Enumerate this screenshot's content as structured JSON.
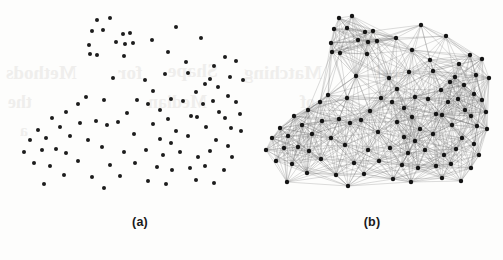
{
  "figure": {
    "background_color": "#fdfdfc",
    "panels": [
      {
        "id": "a",
        "caption": "(a)",
        "kind": "scatter",
        "description": "Scattered point set"
      },
      {
        "id": "b",
        "caption": "(b)",
        "kind": "graph",
        "description": "Proximity graph built on the point set"
      }
    ]
  },
  "captions": {
    "panel_a": "(a)",
    "panel_b": "(b)"
  },
  "style": {
    "point_color": "#1c1c1c",
    "node_color": "#141414",
    "edge_color": "#6f6f6f",
    "caption_color": "#1a1a1a",
    "bleed_color": "#efeeec",
    "point_radius": 2.0,
    "node_radius": 2.2,
    "edge_width": 0.45,
    "edge_opacity": 0.55
  },
  "bleed_through": [
    {
      "text": "Methods",
      "x": 6,
      "y": 62,
      "size": 19
    },
    {
      "text": "for",
      "x": 118,
      "y": 62,
      "size": 19
    },
    {
      "text": "Shape",
      "x": 168,
      "y": 60,
      "size": 19
    },
    {
      "text": "Matching",
      "x": 244,
      "y": 62,
      "size": 19
    },
    {
      "text": "and",
      "x": 376,
      "y": 62,
      "size": 19
    },
    {
      "text": "the",
      "x": 8,
      "y": 92,
      "size": 18
    },
    {
      "text": "Median",
      "x": 148,
      "y": 92,
      "size": 18
    },
    {
      "text": "of",
      "x": 300,
      "y": 92,
      "size": 18
    },
    {
      "text": "a",
      "x": 20,
      "y": 122,
      "size": 16
    }
  ],
  "chart_data": [
    {
      "type": "scatter",
      "title": "(a)",
      "xlabel": "",
      "ylabel": "",
      "grid": false,
      "legend": "none",
      "xlim": [
        0,
        251
      ],
      "ylim": [
        0,
        205
      ],
      "n_points": 100,
      "points": [
        [
          97,
          20
        ],
        [
          110,
          18
        ],
        [
          92,
          31
        ],
        [
          103,
          30
        ],
        [
          123,
          34
        ],
        [
          130,
          33
        ],
        [
          116,
          42
        ],
        [
          89,
          45
        ],
        [
          125,
          44
        ],
        [
          133,
          43
        ],
        [
          152,
          40
        ],
        [
          90,
          54
        ],
        [
          97,
          55
        ],
        [
          124,
          56
        ],
        [
          168,
          52
        ],
        [
          176,
          27
        ],
        [
          186,
          62
        ],
        [
          201,
          38
        ],
        [
          214,
          66
        ],
        [
          225,
          57
        ],
        [
          165,
          74
        ],
        [
          188,
          73
        ],
        [
          236,
          61
        ],
        [
          210,
          79
        ],
        [
          205,
          84
        ],
        [
          145,
          80
        ],
        [
          153,
          91
        ],
        [
          113,
          78
        ],
        [
          196,
          92
        ],
        [
          218,
          87
        ],
        [
          230,
          77
        ],
        [
          243,
          80
        ],
        [
          86,
          97
        ],
        [
          171,
          99
        ],
        [
          183,
          101
        ],
        [
          203,
          104
        ],
        [
          160,
          110
        ],
        [
          213,
          101
        ],
        [
          228,
          96
        ],
        [
          236,
          102
        ],
        [
          78,
          104
        ],
        [
          104,
          100
        ],
        [
          137,
          100
        ],
        [
          148,
          104
        ],
        [
          66,
          112
        ],
        [
          127,
          113
        ],
        [
          168,
          119
        ],
        [
          191,
          116
        ],
        [
          197,
          117
        ],
        [
          219,
          112
        ],
        [
          225,
          118
        ],
        [
          240,
          114
        ],
        [
          52,
          118
        ],
        [
          60,
          127
        ],
        [
          38,
          130
        ],
        [
          80,
          123
        ],
        [
          96,
          121
        ],
        [
          107,
          125
        ],
        [
          118,
          122
        ],
        [
          153,
          124
        ],
        [
          176,
          131
        ],
        [
          206,
          127
        ],
        [
          231,
          128
        ],
        [
          241,
          131
        ],
        [
          30,
          140
        ],
        [
          46,
          138
        ],
        [
          70,
          136
        ],
        [
          88,
          140
        ],
        [
          134,
          134
        ],
        [
          160,
          139
        ],
        [
          171,
          143
        ],
        [
          188,
          136
        ],
        [
          216,
          140
        ],
        [
          228,
          146
        ],
        [
          24,
          152
        ],
        [
          42,
          150
        ],
        [
          56,
          149
        ],
        [
          66,
          153
        ],
        [
          102,
          147
        ],
        [
          124,
          152
        ],
        [
          146,
          150
        ],
        [
          163,
          155
        ],
        [
          180,
          152
        ],
        [
          198,
          157
        ],
        [
          210,
          151
        ],
        [
          232,
          157
        ],
        [
          34,
          163
        ],
        [
          50,
          166
        ],
        [
          78,
          161
        ],
        [
          110,
          165
        ],
        [
          135,
          163
        ],
        [
          157,
          167
        ],
        [
          172,
          170
        ],
        [
          190,
          168
        ],
        [
          205,
          166
        ],
        [
          224,
          170
        ],
        [
          64,
          175
        ],
        [
          92,
          177
        ],
        [
          120,
          176
        ],
        [
          148,
          181
        ],
        [
          166,
          184
        ],
        [
          196,
          180
        ],
        [
          214,
          183
        ],
        [
          44,
          184
        ],
        [
          104,
          188
        ]
      ]
    },
    {
      "type": "scatter",
      "title": "(b)",
      "xlabel": "",
      "ylabel": "",
      "grid": false,
      "legend": "none",
      "xlim": [
        0,
        252
      ],
      "ylim": [
        0,
        205
      ],
      "n_nodes": 100,
      "description": "Same point distribution rendered as a dense proximity (beta-skeleton style) graph; nodes are black dots, edges are thin grey straight segments. Graph is denser on the right side.",
      "nodes": [
        [
          88,
          18
        ],
        [
          101,
          16
        ],
        [
          83,
          29
        ],
        [
          96,
          28
        ],
        [
          114,
          32
        ],
        [
          122,
          31
        ],
        [
          107,
          40
        ],
        [
          80,
          43
        ],
        [
          117,
          42
        ],
        [
          126,
          41
        ],
        [
          145,
          38
        ],
        [
          81,
          52
        ],
        [
          89,
          53
        ],
        [
          116,
          54
        ],
        [
          161,
          50
        ],
        [
          170,
          25
        ],
        [
          179,
          60
        ],
        [
          195,
          36
        ],
        [
          208,
          64
        ],
        [
          219,
          55
        ],
        [
          158,
          72
        ],
        [
          182,
          71
        ],
        [
          231,
          59
        ],
        [
          204,
          77
        ],
        [
          199,
          82
        ],
        [
          138,
          78
        ],
        [
          146,
          89
        ],
        [
          105,
          76
        ],
        [
          190,
          90
        ],
        [
          213,
          85
        ],
        [
          225,
          75
        ],
        [
          238,
          78
        ],
        [
          77,
          95
        ],
        [
          164,
          97
        ],
        [
          177,
          99
        ],
        [
          197,
          102
        ],
        [
          153,
          108
        ],
        [
          207,
          99
        ],
        [
          223,
          94
        ],
        [
          231,
          100
        ],
        [
          69,
          102
        ],
        [
          96,
          98
        ],
        [
          130,
          98
        ],
        [
          141,
          102
        ],
        [
          57,
          110
        ],
        [
          119,
          111
        ],
        [
          161,
          117
        ],
        [
          185,
          114
        ],
        [
          191,
          115
        ],
        [
          214,
          110
        ],
        [
          220,
          116
        ],
        [
          235,
          112
        ],
        [
          43,
          116
        ],
        [
          51,
          125
        ],
        [
          29,
          128
        ],
        [
          71,
          121
        ],
        [
          88,
          119
        ],
        [
          99,
          123
        ],
        [
          110,
          120
        ],
        [
          146,
          122
        ],
        [
          169,
          129
        ],
        [
          201,
          125
        ],
        [
          226,
          126
        ],
        [
          236,
          129
        ],
        [
          21,
          138
        ],
        [
          37,
          136
        ],
        [
          61,
          134
        ],
        [
          80,
          138
        ],
        [
          127,
          132
        ],
        [
          153,
          137
        ],
        [
          164,
          141
        ],
        [
          182,
          134
        ],
        [
          211,
          138
        ],
        [
          223,
          144
        ],
        [
          15,
          150
        ],
        [
          33,
          148
        ],
        [
          47,
          147
        ],
        [
          58,
          151
        ],
        [
          94,
          145
        ],
        [
          117,
          150
        ],
        [
          139,
          148
        ],
        [
          157,
          153
        ],
        [
          174,
          150
        ],
        [
          193,
          155
        ],
        [
          205,
          149
        ],
        [
          228,
          155
        ],
        [
          25,
          161
        ],
        [
          41,
          164
        ],
        [
          70,
          159
        ],
        [
          103,
          163
        ],
        [
          128,
          161
        ],
        [
          151,
          165
        ],
        [
          167,
          168
        ],
        [
          185,
          166
        ],
        [
          200,
          164
        ],
        [
          220,
          168
        ],
        [
          56,
          173
        ],
        [
          85,
          175
        ],
        [
          113,
          174
        ],
        [
          142,
          179
        ],
        [
          160,
          182
        ],
        [
          191,
          178
        ],
        [
          210,
          181
        ],
        [
          36,
          182
        ],
        [
          97,
          186
        ]
      ],
      "edge_rule": "connect node pairs whose distance is below a locally adaptive threshold (denser sampling on the right yields a denser subgraph)"
    }
  ]
}
